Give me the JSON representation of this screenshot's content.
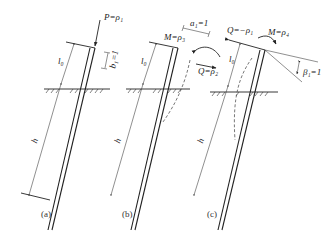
{
  "figure": {
    "panels": [
      {
        "id": "a",
        "caption": "(a)",
        "labels": {
          "load": "P=ρ₁",
          "free_length": "l₀",
          "embedded_length": "h",
          "unit_disp": "b₁=1"
        }
      },
      {
        "id": "b",
        "caption": "(b)",
        "labels": {
          "moment": "M=ρ₃",
          "free_length": "l₀",
          "embedded_length": "h",
          "unit_disp": "a₁=1",
          "shear": "Q=ρ₂"
        }
      },
      {
        "id": "c",
        "caption": "(c)",
        "labels": {
          "shear": "Q=−ρ₁",
          "moment": "M=ρ₄",
          "free_length": "l₀",
          "embedded_length": "h",
          "rotation": "β₁=1"
        }
      }
    ]
  }
}
